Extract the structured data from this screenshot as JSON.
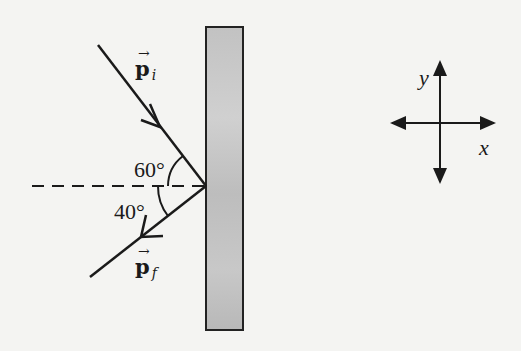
{
  "diagram": {
    "type": "physics-momentum-reflection",
    "wall": {
      "fill": "#b9b9b9",
      "stroke": "#222222"
    },
    "incident_vector": {
      "label": "p",
      "subscript": "i",
      "angle_label": "60°"
    },
    "reflected_vector": {
      "label": "p",
      "subscript": "f",
      "angle_label": "40°"
    },
    "normal_line": {
      "style": "dashed"
    },
    "axes": {
      "x_label": "x",
      "y_label": "y"
    },
    "colors": {
      "line": "#1a1a1a",
      "background": "#f4f4f2"
    }
  }
}
